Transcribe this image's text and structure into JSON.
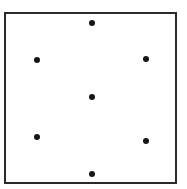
{
  "figure": {
    "background_color": "#ffffff",
    "frame": {
      "x": 4,
      "y": 12,
      "width": 173,
      "height": 172,
      "border_color": "#2b2b2b",
      "border_width": 2,
      "fill_color": "#fefefe"
    },
    "point_color": "#151515",
    "point_diameter": 6
  },
  "chart_data": {
    "type": "scatter",
    "title": "",
    "subtitle": "",
    "xlabel": "",
    "ylabel": "",
    "grid": false,
    "legend": null,
    "axis_ticks": [],
    "tick_labels": [],
    "annotations": [],
    "xlim": [
      4,
      177
    ],
    "ylim": [
      12,
      184
    ],
    "series": [
      {
        "name": "points",
        "marker": "filled-circle",
        "color": "#151515",
        "size": 6,
        "points": [
          {
            "label": "top-center",
            "x": 92,
            "y": 23
          },
          {
            "label": "upper-left",
            "x": 37,
            "y": 60
          },
          {
            "label": "upper-right",
            "x": 146,
            "y": 59
          },
          {
            "label": "center",
            "x": 92,
            "y": 97
          },
          {
            "label": "lower-left",
            "x": 37,
            "y": 137
          },
          {
            "label": "lower-right",
            "x": 146,
            "y": 141
          },
          {
            "label": "bottom-center",
            "x": 92,
            "y": 174
          }
        ]
      }
    ]
  }
}
